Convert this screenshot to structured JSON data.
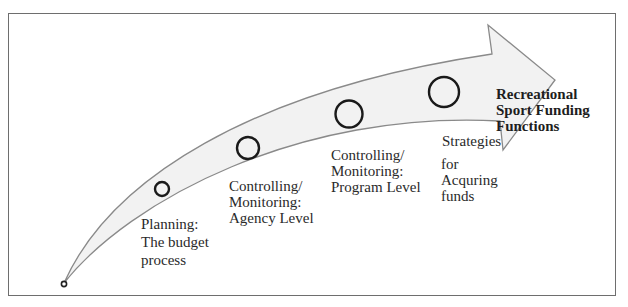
{
  "diagram": {
    "title": "Recreational\nSport Funding\nFunctions",
    "stages": [
      {
        "label": "Planning:\nThe budget\nprocess"
      },
      {
        "label": "Controlling/\nMonitoring:\nAgency Level"
      },
      {
        "label": "Controlling/\nMonitoring:\nProgram Level"
      },
      {
        "label_line1": "Strategies",
        "label_rest": "for\nAcquring\nfunds"
      }
    ],
    "colors": {
      "arrow_fill": "#f2f2f2",
      "arrow_stroke": "#8a8a8a",
      "circle_stroke": "#1a1a1a",
      "frame": "#6e6e6e"
    }
  }
}
